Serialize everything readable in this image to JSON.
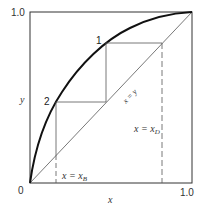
{
  "diagram": {
    "type": "McCabe-Thiele operating diagram",
    "axes": {
      "x_label": "x",
      "y_label": "y",
      "origin_label": "0",
      "x_max_label": "1.0",
      "y_max_label": "1.0"
    },
    "curves": {
      "equilibrium_curve": "equilibrium",
      "diagonal_label": "x = y"
    },
    "points": [
      {
        "label": "1"
      },
      {
        "label": "2"
      }
    ],
    "lines": {
      "bottoms": {
        "lhs": "x = x",
        "sub": "B"
      },
      "distillate": {
        "lhs": "x = x",
        "sub": "D"
      }
    },
    "colors": {
      "line": "#222222",
      "thin_line": "#555555"
    }
  }
}
